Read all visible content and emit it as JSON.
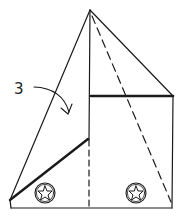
{
  "diagram": {
    "type": "origami-fold-step",
    "step_label": "3",
    "colors": {
      "stroke": "#1a1a1a",
      "background": "#ffffff"
    },
    "elements": [
      {
        "kind": "solid-line",
        "name": "left-slant-edge"
      },
      {
        "kind": "solid-line",
        "name": "right-slant-edge"
      },
      {
        "kind": "solid-line",
        "name": "center-vertical"
      },
      {
        "kind": "thick-line",
        "name": "upper-horizontal-edge"
      },
      {
        "kind": "thick-line",
        "name": "lower-diagonal-edge"
      },
      {
        "kind": "dashed-line",
        "name": "center-vertical-fold"
      },
      {
        "kind": "dashed-line",
        "name": "diagonal-fold"
      },
      {
        "kind": "arrow",
        "name": "fold-arrow"
      },
      {
        "kind": "icon",
        "name": "star-circle-left"
      },
      {
        "kind": "icon",
        "name": "star-circle-right"
      }
    ]
  }
}
